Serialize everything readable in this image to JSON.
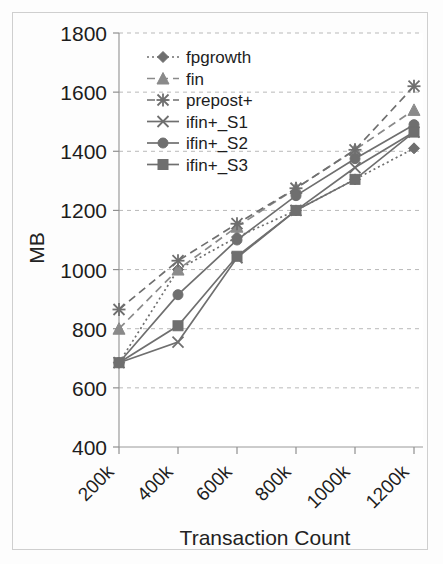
{
  "chart_data": {
    "type": "line",
    "title": "",
    "xlabel": "Transaction Count",
    "ylabel": "MB",
    "categories": [
      "200k",
      "400k",
      "600k",
      "800k",
      "1000k",
      "1200k"
    ],
    "ylim": [
      400,
      1800
    ],
    "yticks": [
      400,
      600,
      800,
      1000,
      1200,
      1400,
      1600,
      1800
    ],
    "grid": true,
    "legend_position": "top-center-inside",
    "series": [
      {
        "name": "fpgrowth",
        "marker": "diamond",
        "line": "dotted",
        "color": "#6f6f6f",
        "values": [
          685,
          1000,
          1110,
          1200,
          1305,
          1410
        ]
      },
      {
        "name": "fin",
        "marker": "triangle",
        "line": "dashed",
        "color": "#8a8a8a",
        "values": [
          800,
          1000,
          1145,
          1275,
          1405,
          1540
        ]
      },
      {
        "name": "prepost+",
        "marker": "asterisk",
        "line": "dashed",
        "color": "#6f6f6f",
        "values": [
          865,
          1030,
          1155,
          1275,
          1405,
          1620
        ]
      },
      {
        "name": "ifin+_S1",
        "marker": "cross",
        "line": "solid",
        "color": "#6f6f6f",
        "values": [
          685,
          755,
          1040,
          1200,
          1345,
          1465
        ]
      },
      {
        "name": "ifin+_S2",
        "marker": "circle",
        "line": "solid",
        "color": "#6f6f6f",
        "values": [
          685,
          915,
          1100,
          1250,
          1375,
          1490
        ]
      },
      {
        "name": "ifin+_S3",
        "marker": "square",
        "line": "solid",
        "color": "#6f6f6f",
        "values": [
          685,
          810,
          1045,
          1200,
          1305,
          1465
        ]
      }
    ]
  },
  "axis": {
    "ylabel": "MB",
    "xlabel": "Transaction Count",
    "ytick_labels": [
      "1800",
      "1600",
      "1400",
      "1200",
      "1000",
      "800",
      "600",
      "400"
    ],
    "xtick_labels": [
      "200k",
      "400k",
      "600k",
      "800k",
      "1000k",
      "1200k"
    ]
  },
  "legend": {
    "items": [
      {
        "label": "fpgrowth"
      },
      {
        "label": "fin"
      },
      {
        "label": "prepost+"
      },
      {
        "label": "ifin+_S1"
      },
      {
        "label": "ifin+_S2"
      },
      {
        "label": "ifin+_S3"
      }
    ]
  }
}
